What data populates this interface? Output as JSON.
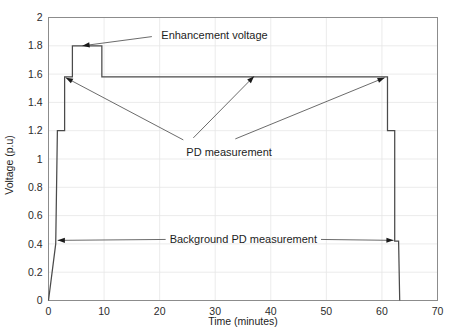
{
  "chart_data": {
    "type": "line",
    "title": "",
    "xlabel": "Time (minutes)",
    "ylabel": "Voltage (p.u)",
    "xlim": [
      0,
      70
    ],
    "ylim": [
      0,
      2
    ],
    "xticks": [
      0,
      10,
      20,
      30,
      40,
      50,
      60,
      70
    ],
    "yticks": [
      0,
      0.2,
      0.4,
      0.6,
      0.8,
      1,
      1.2,
      1.4,
      1.6,
      1.8,
      2
    ],
    "xtick_labels": [
      "0",
      "10",
      "20",
      "30",
      "40",
      "50",
      "60",
      "70"
    ],
    "ytick_labels": [
      "0",
      "0.2",
      "0.4",
      "0.6",
      "0.8",
      "1",
      "1.2",
      "1.4",
      "1.6",
      "1.8",
      "2"
    ],
    "grid": true,
    "legend": "none",
    "series": [
      {
        "name": "Applied test voltage profile",
        "x": [
          0.0,
          1.3,
          1.6,
          1.6,
          2.9,
          2.9,
          4.3,
          4.3,
          9.6,
          9.6,
          61.0,
          61.0,
          62.3,
          62.3,
          63.0,
          63.2
        ],
        "y": [
          0.0,
          0.4,
          1.2,
          1.2,
          1.2,
          1.58,
          1.58,
          1.8,
          1.8,
          1.58,
          1.58,
          1.2,
          1.2,
          0.42,
          0.42,
          0.0
        ]
      }
    ],
    "annotations": [
      {
        "label": "Enhancement voltage",
        "text_x": 20.3,
        "text_y": 1.875,
        "arrow_from_x": 18.6,
        "arrow_from_y": 1.865,
        "arrow_to_x": 6.1,
        "arrow_to_y": 1.8
      },
      {
        "label": "PD measurement",
        "text_x": 24.8,
        "text_y": 1.135,
        "arrow_left_to_x": 3.1,
        "arrow_left_to_y": 1.575,
        "arrow_right_to_x": 60.5,
        "arrow_right_to_y": 1.575,
        "arrow_up_to_x": 37.0,
        "arrow_up_to_y": 1.585
      },
      {
        "label": "Background PD measurement",
        "text_x": 21.8,
        "text_y": 0.435,
        "arrow_left_to_x": 1.65,
        "arrow_left_to_y": 0.425,
        "arrow_right_to_x": 62.1,
        "arrow_right_to_y": 0.425
      }
    ]
  },
  "colors": {
    "background": "#ffffff",
    "grid": "#e6e6e6",
    "frame": "#8c8c8c",
    "data": "#4a4a4a",
    "text": "#1d1d1d",
    "leader": "#5a5a5a"
  }
}
